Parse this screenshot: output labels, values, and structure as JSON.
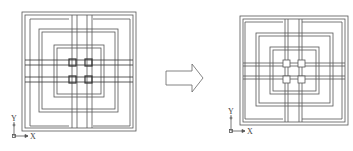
{
  "figure": {
    "colors": {
      "line": "#555555",
      "background": "#ffffff"
    },
    "left_drawing": {
      "name": "before",
      "axis": {
        "y_label": "Y",
        "x_label": "X"
      }
    },
    "arrow": {
      "direction": "right",
      "icon": "block-arrow-right"
    },
    "right_drawing": {
      "name": "after",
      "axis": {
        "y_label": "Y",
        "x_label": "X"
      }
    }
  }
}
